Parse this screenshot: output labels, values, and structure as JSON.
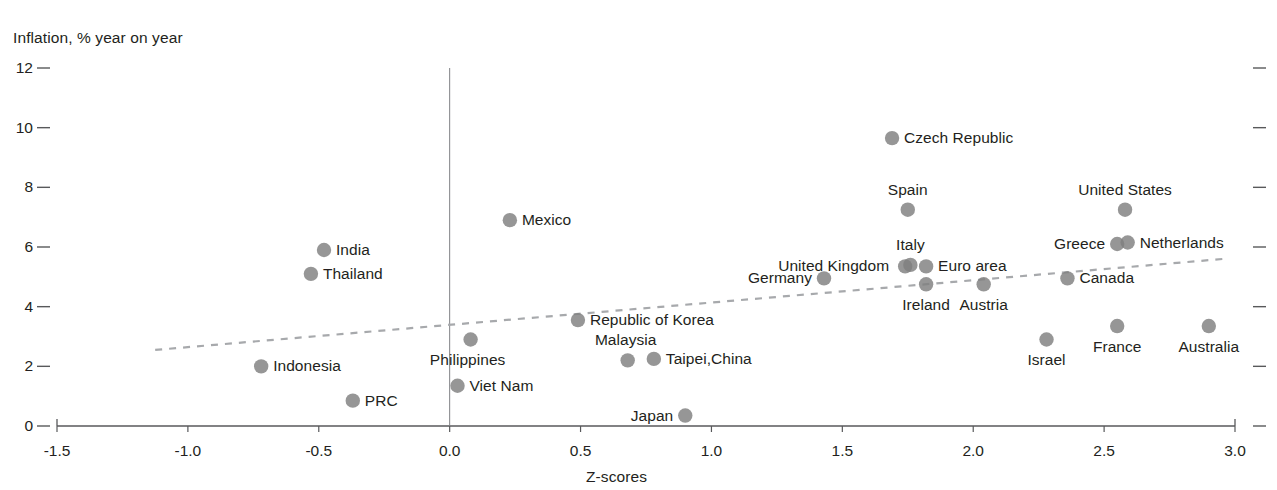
{
  "chart_data": {
    "type": "scatter",
    "title": "",
    "ylabel": "Inflation, % year on year",
    "xlabel": "Z-scores",
    "xlim": [
      -1.5,
      3.0
    ],
    "ylim": [
      0,
      12
    ],
    "xticks": [
      "-1.5",
      "-1.0",
      "-0.5",
      "0.0",
      "0.5",
      "1.0",
      "1.5",
      "2.0",
      "2.5",
      "3.0"
    ],
    "xtick_values": [
      -1.5,
      -1.0,
      -0.5,
      0.0,
      0.5,
      1.0,
      1.5,
      2.0,
      2.5,
      3.0
    ],
    "yticks": [
      "0",
      "2",
      "4",
      "6",
      "8",
      "10",
      "12"
    ],
    "ytick_values": [
      0,
      2,
      4,
      6,
      8,
      10,
      12
    ],
    "grid": false,
    "zero_line": true,
    "legend": "none",
    "marker_color": "#7f7f7f",
    "text_color": "#231f20",
    "axis_color": "#58595b",
    "trendline": {
      "style": "dashed",
      "color": "#a7a9ac",
      "x_start": -1.125,
      "y_start": 2.55,
      "x_end": 2.955,
      "y_end": 5.6
    },
    "points": [
      {
        "name": "India",
        "x": -0.48,
        "y": 5.9,
        "label_pos": "right"
      },
      {
        "name": "Thailand",
        "x": -0.53,
        "y": 5.1,
        "label_pos": "right"
      },
      {
        "name": "Indonesia",
        "x": -0.72,
        "y": 2.0,
        "label_pos": "right"
      },
      {
        "name": "PRC",
        "x": -0.37,
        "y": 0.85,
        "label_pos": "right"
      },
      {
        "name": "Philippines",
        "x": 0.08,
        "y": 2.9,
        "label_pos": "below-left"
      },
      {
        "name": "Viet Nam",
        "x": 0.03,
        "y": 1.35,
        "label_pos": "right"
      },
      {
        "name": "Mexico",
        "x": 0.23,
        "y": 6.9,
        "label_pos": "right"
      },
      {
        "name": "Republic of Korea",
        "x": 0.49,
        "y": 3.55,
        "label_pos": "right"
      },
      {
        "name": "Malaysia",
        "x": 0.68,
        "y": 2.2,
        "label_pos": "above-left"
      },
      {
        "name": "Taipei,China",
        "x": 0.78,
        "y": 2.25,
        "label_pos": "right"
      },
      {
        "name": "Japan",
        "x": 0.9,
        "y": 0.35,
        "label_pos": "left"
      },
      {
        "name": "Germany",
        "x": 1.43,
        "y": 4.95,
        "label_pos": "left"
      },
      {
        "name": "United Kingdom",
        "x": 1.74,
        "y": 5.35,
        "label_pos": "far-left"
      },
      {
        "name": "Italy",
        "x": 1.76,
        "y": 5.4,
        "label_pos": "above"
      },
      {
        "name": "Euro area",
        "x": 1.82,
        "y": 5.35,
        "label_pos": "right"
      },
      {
        "name": "Spain",
        "x": 1.75,
        "y": 7.25,
        "label_pos": "above"
      },
      {
        "name": "Czech Republic",
        "x": 1.69,
        "y": 9.65,
        "label_pos": "right"
      },
      {
        "name": "Ireland",
        "x": 1.82,
        "y": 4.75,
        "label_pos": "below"
      },
      {
        "name": "Austria",
        "x": 2.04,
        "y": 4.75,
        "label_pos": "below"
      },
      {
        "name": "Israel",
        "x": 2.28,
        "y": 2.9,
        "label_pos": "below"
      },
      {
        "name": "Canada",
        "x": 2.36,
        "y": 4.95,
        "label_pos": "right"
      },
      {
        "name": "Greece",
        "x": 2.55,
        "y": 6.1,
        "label_pos": "left"
      },
      {
        "name": "Netherlands",
        "x": 2.59,
        "y": 6.15,
        "label_pos": "right"
      },
      {
        "name": "United States",
        "x": 2.58,
        "y": 7.25,
        "label_pos": "above"
      },
      {
        "name": "France",
        "x": 2.55,
        "y": 3.35,
        "label_pos": "below"
      },
      {
        "name": "Australia",
        "x": 2.9,
        "y": 3.35,
        "label_pos": "below"
      }
    ]
  }
}
